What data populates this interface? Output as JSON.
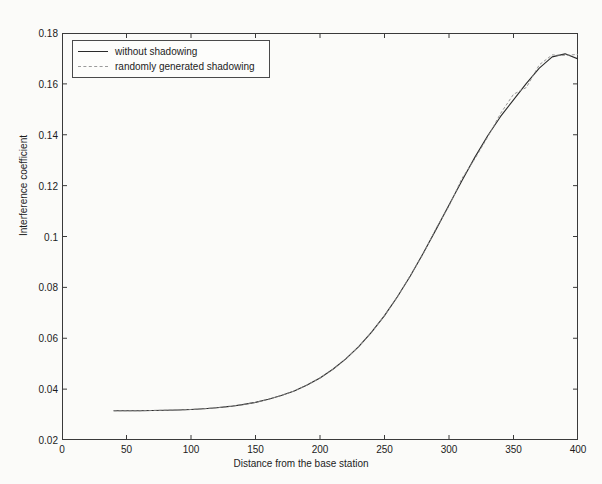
{
  "chart_data": {
    "type": "line",
    "title": "",
    "xlabel": "Distance from the base station",
    "ylabel": "Interference coefficient",
    "xlim": [
      0,
      400
    ],
    "ylim": [
      0.02,
      0.18
    ],
    "xticks": [
      0,
      50,
      100,
      150,
      200,
      250,
      300,
      350,
      400
    ],
    "xtick_labels": [
      "0",
      "50",
      "100",
      "150",
      "200",
      "250",
      "300",
      "350",
      "400"
    ],
    "yticks": [
      0.02,
      0.04,
      0.06,
      0.08,
      0.1,
      0.12,
      0.14,
      0.16,
      0.18
    ],
    "ytick_labels": [
      "0.02",
      "0.04",
      "0.06",
      "0.08",
      "0.1",
      "0.12",
      "0.14",
      "0.16",
      "0.18"
    ],
    "grid": false,
    "legend_position": "upper-left",
    "series": [
      {
        "name": "without shadowing",
        "style": "solid",
        "color": "#2a2a2a",
        "x": [
          40,
          50,
          60,
          70,
          80,
          90,
          100,
          110,
          120,
          130,
          140,
          150,
          160,
          170,
          180,
          190,
          200,
          210,
          220,
          230,
          240,
          250,
          260,
          270,
          280,
          290,
          300,
          310,
          320,
          330,
          340,
          350,
          360,
          370,
          380,
          390,
          400
        ],
        "y": [
          0.0315,
          0.0315,
          0.0315,
          0.0316,
          0.0317,
          0.0318,
          0.032,
          0.0323,
          0.0327,
          0.0332,
          0.0339,
          0.0348,
          0.036,
          0.0375,
          0.0393,
          0.0416,
          0.0444,
          0.0478,
          0.0519,
          0.0567,
          0.0624,
          0.0689,
          0.0763,
          0.0845,
          0.0934,
          0.1028,
          0.1124,
          0.1219,
          0.1311,
          0.1396,
          0.1472,
          0.1537,
          0.1602,
          0.1662,
          0.1706,
          0.1718,
          0.1698
        ]
      },
      {
        "name": "randomly generated shadowing",
        "style": "dashed",
        "color": "#8a8a8a",
        "x": [
          40,
          50,
          60,
          70,
          80,
          90,
          100,
          110,
          120,
          130,
          140,
          150,
          160,
          170,
          180,
          190,
          200,
          210,
          220,
          230,
          240,
          250,
          260,
          270,
          280,
          290,
          300,
          310,
          320,
          330,
          340,
          350,
          360,
          370,
          380,
          390,
          400
        ],
        "y": [
          0.0315,
          0.0315,
          0.0315,
          0.0316,
          0.0317,
          0.0318,
          0.032,
          0.0323,
          0.0327,
          0.0332,
          0.0339,
          0.0348,
          0.036,
          0.0375,
          0.0393,
          0.0416,
          0.0444,
          0.0478,
          0.0519,
          0.0567,
          0.0624,
          0.0689,
          0.0762,
          0.0847,
          0.0931,
          0.1032,
          0.1119,
          0.1228,
          0.1305,
          0.1391,
          0.1484,
          0.1559,
          0.1586,
          0.1675,
          0.1714,
          0.1712,
          0.1716
        ]
      }
    ]
  },
  "legend": {
    "entries": [
      {
        "label": "without shadowing"
      },
      {
        "label": "randomly generated shadowing"
      }
    ]
  }
}
